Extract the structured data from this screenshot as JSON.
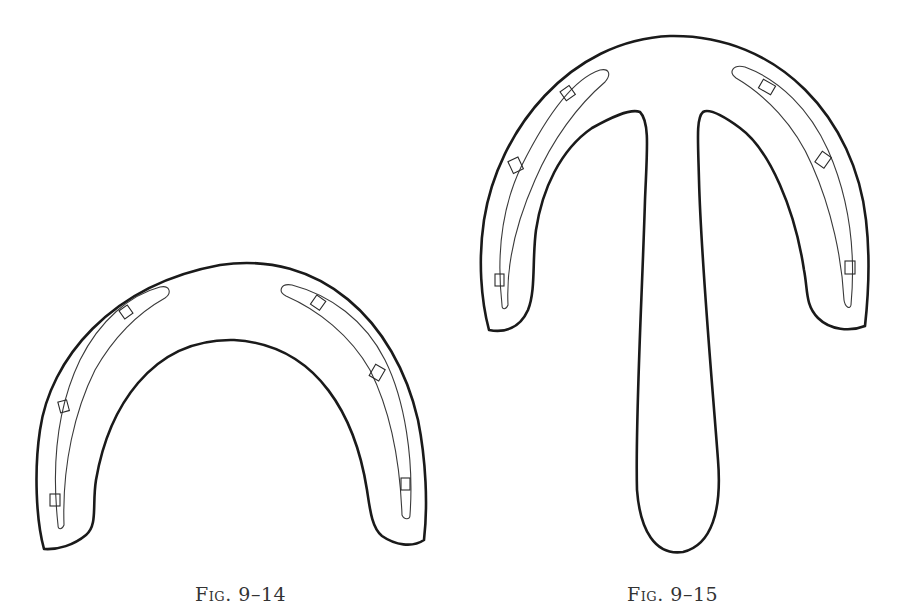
{
  "page": {
    "type": "book-figure-page",
    "background": "#ffffff",
    "ink_color": "#1a1a1a"
  },
  "figures": [
    {
      "id": "fig-9-14",
      "caption_prefix": "Fig.",
      "caption_number": "9–14",
      "caption": "Fig. 9–14",
      "description": "Horseshoe-shaped outline with inner fullered groove and six nail holes"
    },
    {
      "id": "fig-9-15",
      "caption_prefix": "Fig.",
      "caption_number": "9–15",
      "caption": "Fig. 9–15",
      "description": "Horseshoe-shaped outline with long central stem (T-shape), inner fullered groove and six nail holes"
    }
  ]
}
